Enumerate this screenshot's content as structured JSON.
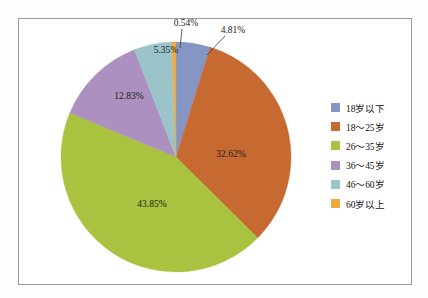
{
  "chart_data": {
    "type": "pie",
    "title": "",
    "subtitle": "",
    "xlabel": "",
    "ylabel": "",
    "grid": false,
    "legend_position": "right",
    "start_angle_deg": 0,
    "direction": "clockwise",
    "categories": [
      "18岁以下",
      "18～25岁",
      "26～35岁",
      "36～45岁",
      "46～60岁",
      "60岁以上"
    ],
    "values": [
      4.81,
      32.62,
      43.85,
      12.83,
      5.35,
      0.54
    ],
    "value_labels": [
      "4.81%",
      "32.62%",
      "43.85%",
      "12.83%",
      "5.35%",
      "0.54%"
    ],
    "colors": [
      "#8596c4",
      "#c66a32",
      "#a9c23f",
      "#ab90c0",
      "#9bc4c9",
      "#f2a93b"
    ],
    "slices": [
      {
        "label": "18岁以下",
        "value": 4.81,
        "value_label": "4.81%",
        "color": "#8596c4",
        "label_outside": true
      },
      {
        "label": "18～25岁",
        "value": 32.62,
        "value_label": "32.62%",
        "color": "#c66a32",
        "label_outside": false
      },
      {
        "label": "26～35岁",
        "value": 43.85,
        "value_label": "43.85%",
        "color": "#a9c23f",
        "label_outside": false
      },
      {
        "label": "36～45岁",
        "value": 12.83,
        "value_label": "12.83%",
        "color": "#ab90c0",
        "label_outside": false
      },
      {
        "label": "46～60岁",
        "value": 5.35,
        "value_label": "5.35%",
        "color": "#9bc4c9",
        "label_outside": false
      },
      {
        "label": "60岁以上",
        "value": 0.54,
        "value_label": "0.54%",
        "color": "#f2a93b",
        "label_outside": true
      }
    ]
  },
  "legend": {
    "items": [
      {
        "label": "18岁以下",
        "color": "#8596c4"
      },
      {
        "label": "18～25岁",
        "color": "#c66a32"
      },
      {
        "label": "26～35岁",
        "color": "#a9c23f"
      },
      {
        "label": "36～45岁",
        "color": "#ab90c0"
      },
      {
        "label": "46～60岁",
        "color": "#9bc4c9"
      },
      {
        "label": "60岁以上",
        "color": "#f2a93b"
      }
    ]
  },
  "labels": {
    "pct_0": "4.81%",
    "pct_1": "32.62%",
    "pct_2": "43.85%",
    "pct_3": "12.83%",
    "pct_4": "5.35%",
    "pct_5": "0.54%"
  },
  "style": {
    "frame_border_color": "#9a9a9a",
    "background": "#ffffff",
    "label_text_color": "#1a1a1a"
  }
}
